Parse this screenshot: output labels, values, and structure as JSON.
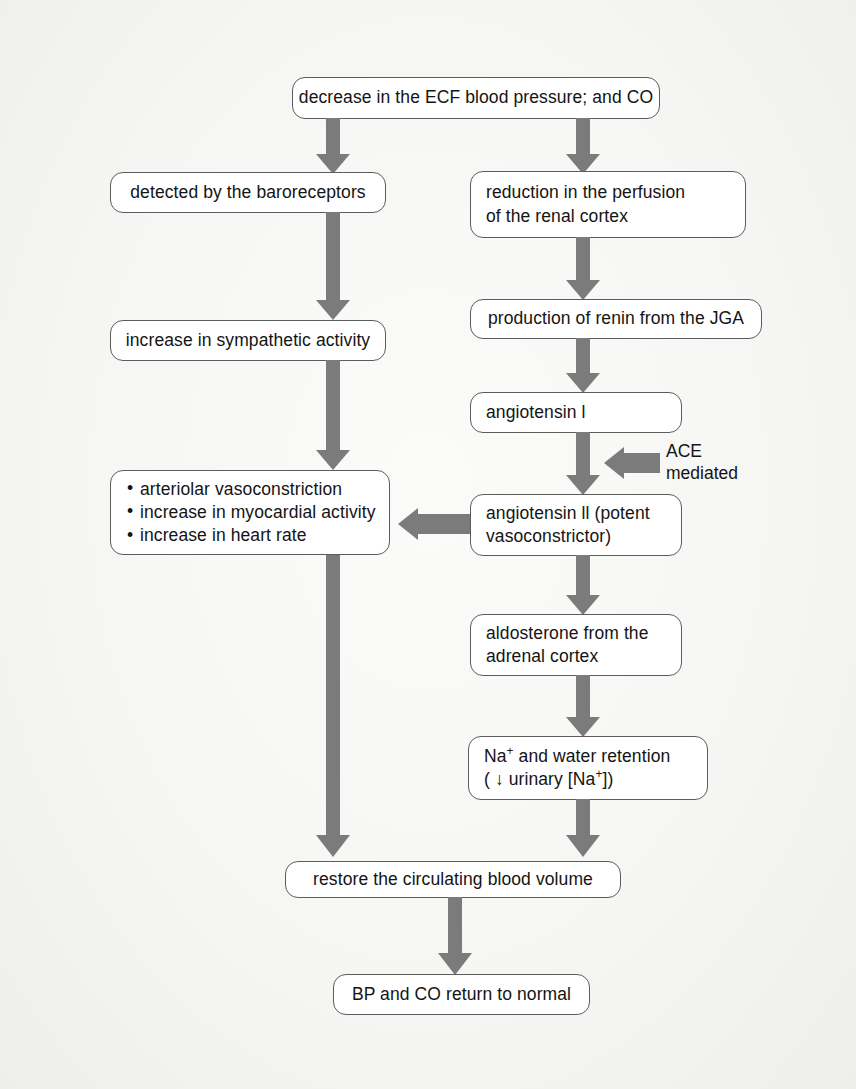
{
  "diagram": {
    "arrow_color": "#7b7b7b",
    "box_border_color": "#5c5c5c",
    "background_color": "#f4f4f2",
    "nodes": {
      "decrease_bp": {
        "line1": "decrease in the ECF blood pressure; and CO"
      },
      "baroreceptors": {
        "line1": "detected by the baroreceptors"
      },
      "perfusion": {
        "line1": "reduction in the perfusion",
        "line2": "of the renal cortex"
      },
      "sympathetic": {
        "line1": "increase in sympathetic activity"
      },
      "renin": {
        "line1": "production of renin from the JGA"
      },
      "angiotensin_1": {
        "line1": "angiotensin l"
      },
      "effects": {
        "bullet1": "arteriolar vasoconstriction",
        "bullet2": "increase in myocardial activity",
        "bullet3": "increase in heart rate"
      },
      "angiotensin_2": {
        "line1": "angiotensin ll (potent",
        "line2": "vasoconstrictor)"
      },
      "aldosterone": {
        "line1": "aldosterone from the",
        "line2": "adrenal cortex"
      },
      "sodium_retention": {
        "line1_pre": "Na",
        "line1_sup": "+",
        "line1_post": " and water retention",
        "line2_pre": "( ↓ urinary [Na",
        "line2_sup": "+",
        "line2_post": "])"
      },
      "restore_volume": {
        "line1": "restore the circulating blood volume"
      },
      "normal": {
        "line1": "BP and CO return to normal"
      }
    },
    "labels": {
      "ace": {
        "line1": "ACE",
        "line2": "mediated"
      }
    }
  }
}
